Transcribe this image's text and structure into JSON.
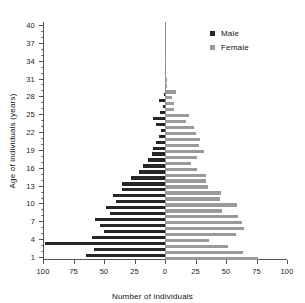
{
  "chart_data": {
    "type": "bar",
    "orientation": "horizontal",
    "subtype": "population-pyramid",
    "title": "",
    "xlabel": "Number of individuals",
    "ylabel": "Age of individuals (years)",
    "xlim": [
      -100,
      100
    ],
    "ylim": [
      0.5,
      40.5
    ],
    "grid": false,
    "legend_position": "top-right",
    "x_tick_values": [
      -100,
      -75,
      -50,
      -25,
      0,
      25,
      50,
      75,
      100
    ],
    "x_tick_labels": [
      "100",
      "75",
      "50",
      "25",
      "0",
      "25",
      "50",
      "75",
      "100"
    ],
    "y_tick_values": [
      1,
      4,
      7,
      10,
      13,
      16,
      19,
      22,
      25,
      28,
      31,
      34,
      37,
      40
    ],
    "y_tick_labels": [
      "1",
      "4",
      "7",
      "10",
      "13",
      "16",
      "19",
      "22",
      "25",
      "28",
      "31",
      "34",
      "37",
      "40"
    ],
    "y_minor_tick_step": 1,
    "categories": [
      1,
      2,
      3,
      4,
      5,
      6,
      7,
      8,
      9,
      10,
      11,
      12,
      13,
      14,
      15,
      16,
      17,
      18,
      19,
      20,
      21,
      22,
      23,
      24,
      25,
      26,
      27,
      28,
      29,
      30,
      31,
      32,
      33,
      34,
      35,
      36,
      37,
      38,
      39,
      40
    ],
    "series": [
      {
        "name": "Male",
        "color": "#262626",
        "side": "left",
        "values": [
          65,
          58,
          98,
          60,
          50,
          53,
          57,
          45,
          48,
          40,
          43,
          35,
          35,
          28,
          21,
          18,
          14,
          11,
          10,
          7,
          5,
          3,
          7,
          10,
          4,
          2,
          5,
          1,
          0,
          0,
          0,
          0,
          0,
          0,
          0,
          0,
          0,
          0,
          0,
          0
        ]
      },
      {
        "name": "Female",
        "color": "#9a9a9a",
        "side": "right",
        "values": [
          76,
          64,
          52,
          36,
          58,
          65,
          63,
          60,
          47,
          59,
          45,
          46,
          35,
          34,
          34,
          26,
          21,
          26,
          32,
          28,
          29,
          25,
          24,
          17,
          20,
          7,
          7,
          6,
          9,
          2,
          2,
          1,
          1,
          1,
          1,
          0,
          0,
          0,
          0,
          0
        ]
      }
    ]
  },
  "legend": {
    "items": [
      {
        "label": "Male",
        "color": "#262626"
      },
      {
        "label": "Female",
        "color": "#9a9a9a"
      }
    ]
  }
}
